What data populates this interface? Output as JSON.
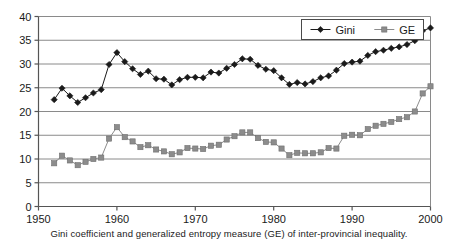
{
  "chart_data": {
    "type": "line",
    "title": "",
    "subtitle": "",
    "caption": "Gini coefficient and generalized entropy measure (GE) of inter-provincial inequality.",
    "xlabel": "",
    "ylabel": "",
    "xlim": [
      1950,
      2000
    ],
    "ylim": [
      0,
      40
    ],
    "xticks": [
      1950,
      1960,
      1970,
      1980,
      1990,
      2000
    ],
    "yticks": [
      0,
      5,
      10,
      15,
      20,
      25,
      30,
      35,
      40
    ],
    "grid": "horizontal",
    "legend_position": "top-right",
    "x": [
      1952,
      1953,
      1954,
      1955,
      1956,
      1957,
      1958,
      1959,
      1960,
      1961,
      1962,
      1963,
      1964,
      1965,
      1966,
      1967,
      1968,
      1969,
      1970,
      1971,
      1972,
      1973,
      1974,
      1975,
      1976,
      1977,
      1978,
      1979,
      1980,
      1981,
      1982,
      1983,
      1984,
      1985,
      1986,
      1987,
      1988,
      1989,
      1990,
      1991,
      1992,
      1993,
      1994,
      1995,
      1996,
      1997,
      1998,
      1999,
      2000
    ],
    "series": [
      {
        "name": "Gini",
        "color": "#1a1a1a",
        "marker": "diamond",
        "values": [
          22.5,
          24.9,
          23.3,
          21.9,
          22.9,
          23.9,
          24.6,
          29.9,
          32.4,
          30.5,
          29.0,
          27.8,
          28.5,
          26.9,
          26.8,
          25.6,
          26.7,
          27.2,
          27.2,
          27.1,
          28.3,
          28.1,
          29.1,
          29.9,
          31.1,
          31.0,
          29.7,
          28.9,
          28.6,
          27.1,
          25.7,
          26.1,
          25.8,
          26.3,
          27.1,
          27.5,
          28.7,
          30.1,
          30.4,
          30.6,
          31.8,
          32.6,
          32.9,
          33.3,
          33.6,
          34.1,
          34.9,
          37.0,
          37.6
        ]
      },
      {
        "name": "GE",
        "color": "#8c8c8c",
        "marker": "square",
        "values": [
          9.1,
          10.7,
          9.7,
          8.7,
          9.4,
          10.0,
          10.3,
          14.3,
          16.7,
          14.6,
          13.7,
          12.5,
          12.9,
          12.0,
          11.6,
          11.0,
          11.4,
          12.3,
          12.2,
          12.1,
          12.8,
          13.0,
          14.1,
          14.8,
          15.6,
          15.6,
          14.4,
          13.6,
          13.5,
          12.2,
          10.8,
          11.3,
          11.2,
          11.2,
          11.4,
          12.3,
          12.2,
          14.9,
          15.1,
          15.0,
          16.3,
          17.0,
          17.4,
          17.8,
          18.4,
          18.8,
          20.0,
          23.8,
          25.3
        ]
      }
    ]
  },
  "legend": {
    "items": [
      {
        "label": "Gini",
        "color": "#1a1a1a",
        "marker": "diamond"
      },
      {
        "label": "GE",
        "color": "#8c8c8c",
        "marker": "square"
      }
    ]
  },
  "axis": {
    "y_labels": [
      "40",
      "35",
      "30",
      "25",
      "20",
      "15",
      "10",
      "5",
      "0"
    ],
    "x_labels": [
      "1950",
      "1960",
      "1970",
      "1980",
      "1990",
      "2000"
    ]
  }
}
